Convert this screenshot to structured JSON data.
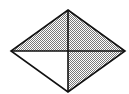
{
  "diagram": {
    "shape": "rhombus",
    "vertices": {
      "top": [
        68,
        10
      ],
      "left": [
        11,
        51
      ],
      "right": [
        125,
        51
      ],
      "bottom": [
        68,
        92
      ],
      "center": [
        68,
        51
      ]
    },
    "regions": [
      {
        "name": "top-left",
        "shaded": true
      },
      {
        "name": "top-right",
        "shaded": true
      },
      {
        "name": "bottom-right",
        "shaded": true
      },
      {
        "name": "bottom-left",
        "shaded": false
      }
    ],
    "colors": {
      "stroke": "#111111",
      "shade_light": "#ffffff",
      "shade_dark": "#7a7a7a",
      "background": "#ffffff"
    }
  }
}
